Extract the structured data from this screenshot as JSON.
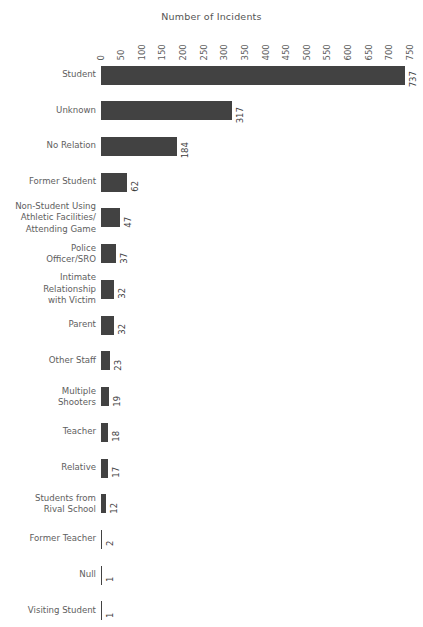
{
  "chart_data": {
    "type": "bar",
    "orientation": "horizontal",
    "title": "Number of Incidents",
    "xlabel": "Number of Incidents",
    "ylabel": "",
    "xlim": [
      0,
      750
    ],
    "grid": false,
    "legend": null,
    "xticks": [
      "0",
      "50",
      "100",
      "150",
      "200",
      "250",
      "300",
      "350",
      "400",
      "450",
      "500",
      "550",
      "600",
      "650",
      "700",
      "750"
    ],
    "xtick_values": [
      0,
      50,
      100,
      150,
      200,
      250,
      300,
      350,
      400,
      450,
      500,
      550,
      600,
      650,
      700,
      750
    ],
    "categories": [
      "Student",
      "Unknown",
      "No Relation",
      "Former Student",
      "Non-Student Using\nAthletic Facilities/\nAttending Game",
      "Police\nOfficer/SRO",
      "Intimate\nRelationship\nwith Victim",
      "Parent",
      "Other  Staff",
      "Multiple\nShooters",
      "Teacher",
      "Relative",
      "Students from\nRival School",
      "Former Teacher",
      "Null",
      "Visiting Student"
    ],
    "values": [
      737,
      317,
      184,
      62,
      47,
      37,
      32,
      32,
      23,
      19,
      18,
      17,
      12,
      2,
      1,
      1
    ],
    "value_labels": [
      "737",
      "317",
      "184",
      "62",
      "47",
      "37",
      "32",
      "32",
      "23",
      "19",
      "18",
      "17",
      "12",
      "2",
      "1",
      "1"
    ],
    "bar_color": "#424242",
    "background_color": "#ffffff",
    "text_color": "#5e5e5e"
  }
}
